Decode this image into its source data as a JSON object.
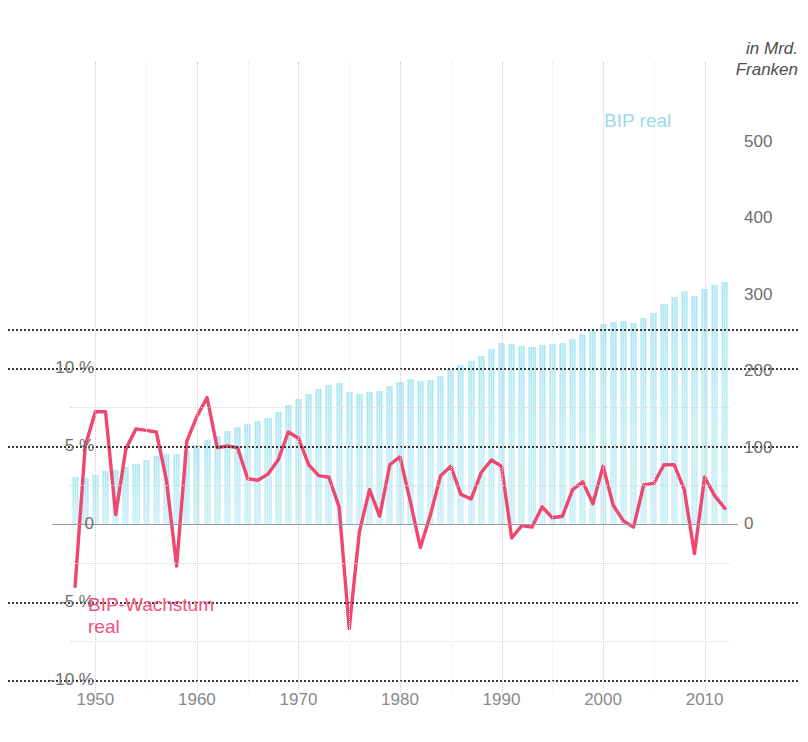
{
  "unit_caption": "in Mrd.\nFranken",
  "series_labels": {
    "bars": "BIP real",
    "line": "BIP-Wachstum\nreal"
  },
  "colors": {
    "bar": "#b9ecf6",
    "line": "#ef476f",
    "grid_major": "#3a3a3a",
    "grid_minor": "#d8d8d8",
    "zero_line": "#9a9aa5",
    "axis_text": "#6e6e6e"
  },
  "chart_data": {
    "type": "bar",
    "title": "",
    "subtitle": "",
    "xlabel": "",
    "ylabel": "in Mrd. Franken",
    "y2label": "",
    "grid": true,
    "legend": "inline",
    "xlim": [
      1947.5,
      2012.5
    ],
    "ylim_left_percent": [
      -10,
      12.5
    ],
    "ylim_right_mrd": [
      0,
      625
    ],
    "left_axis_ticks": [
      "10 %",
      "5 %",
      "0",
      "-5 %",
      "-10 %"
    ],
    "left_axis_values": [
      10,
      5,
      0,
      -5,
      -10
    ],
    "right_axis_ticks": [
      "500",
      "400",
      "300",
      "200",
      "100",
      "0"
    ],
    "right_axis_values": [
      500,
      400,
      300,
      200,
      100,
      0
    ],
    "x_ticks": [
      "1950",
      "1960",
      "1970",
      "1980",
      "1990",
      "2000",
      "2010"
    ],
    "x_tick_values": [
      1950,
      1960,
      1970,
      1980,
      1990,
      2000,
      2010
    ],
    "years": [
      1948,
      1949,
      1950,
      1951,
      1952,
      1953,
      1954,
      1955,
      1956,
      1957,
      1958,
      1959,
      1960,
      1961,
      1962,
      1963,
      1964,
      1965,
      1966,
      1967,
      1968,
      1969,
      1970,
      1971,
      1972,
      1973,
      1974,
      1975,
      1976,
      1977,
      1978,
      1979,
      1980,
      1981,
      1982,
      1983,
      1984,
      1985,
      1986,
      1987,
      1988,
      1989,
      1990,
      1991,
      1992,
      1993,
      1994,
      1995,
      1996,
      1997,
      1998,
      1999,
      2000,
      2001,
      2002,
      2003,
      2004,
      2005,
      2006,
      2007,
      2008,
      2009,
      2010,
      2011,
      2012
    ],
    "series": [
      {
        "name": "BIP real",
        "unit": "Mrd. Franken",
        "axis": "right",
        "type": "bar",
        "values": [
          62,
          60,
          64,
          69,
          71,
          74,
          79,
          84,
          89,
          92,
          91,
          96,
          103,
          110,
          115,
          121,
          127,
          131,
          135,
          139,
          146,
          155,
          164,
          170,
          176,
          182,
          184,
          172,
          170,
          173,
          174,
          180,
          186,
          189,
          187,
          188,
          194,
          203,
          208,
          213,
          220,
          229,
          236,
          235,
          233,
          232,
          234,
          235,
          236,
          242,
          249,
          252,
          261,
          264,
          265,
          263,
          269,
          276,
          287,
          297,
          304,
          298,
          307,
          313,
          316
        ]
      },
      {
        "name": "BIP-Wachstum real",
        "unit": "%",
        "axis": "left",
        "type": "line",
        "values": [
          -4.0,
          5.0,
          7.2,
          7.2,
          0.6,
          4.8,
          6.1,
          6.0,
          5.9,
          2.8,
          -2.7,
          5.3,
          6.9,
          8.1,
          4.9,
          5.0,
          4.9,
          2.9,
          2.8,
          3.2,
          4.1,
          5.9,
          5.5,
          3.8,
          3.1,
          3.0,
          1.1,
          -6.7,
          -0.5,
          2.2,
          0.5,
          3.8,
          4.3,
          1.5,
          -1.5,
          0.6,
          3.1,
          3.7,
          1.9,
          1.6,
          3.3,
          4.1,
          3.7,
          -0.9,
          -0.1,
          -0.2,
          1.1,
          0.4,
          0.5,
          2.2,
          2.7,
          1.3,
          3.7,
          1.2,
          0.2,
          -0.2,
          2.5,
          2.6,
          3.8,
          3.8,
          2.2,
          -1.9,
          3.0,
          1.8,
          1.0
        ]
      }
    ]
  }
}
